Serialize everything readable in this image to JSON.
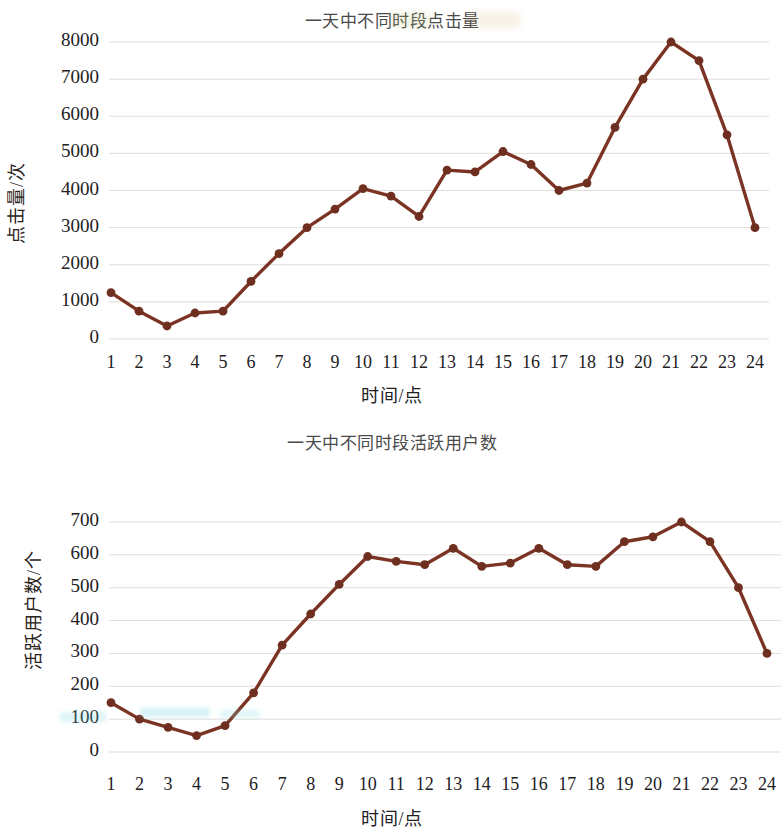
{
  "chart_data": [
    {
      "type": "line",
      "id": "clicks",
      "title": "一天中不同时段点击量",
      "xlabel": "时间/点",
      "ylabel": "点击量/次",
      "categories": [
        "1",
        "2",
        "3",
        "4",
        "5",
        "6",
        "7",
        "8",
        "9",
        "10",
        "11",
        "12",
        "13",
        "14",
        "15",
        "16",
        "17",
        "18",
        "19",
        "20",
        "21",
        "22",
        "23",
        "24"
      ],
      "values": [
        1250,
        750,
        350,
        700,
        750,
        1550,
        2300,
        3000,
        3500,
        4050,
        3850,
        3300,
        4550,
        4500,
        5050,
        4700,
        4000,
        4200,
        5700,
        7000,
        8000,
        7500,
        5500,
        3000
      ],
      "yticks": [
        "0",
        "1000",
        "2000",
        "3000",
        "4000",
        "5000",
        "6000",
        "7000",
        "8000"
      ],
      "ytick_values": [
        0,
        1000,
        2000,
        3000,
        4000,
        5000,
        6000,
        7000,
        8000
      ],
      "ylim": [
        0,
        8000
      ],
      "grid": true,
      "legend": "none",
      "line_color": "#7B3424",
      "marker_color": "#6E2F21"
    },
    {
      "type": "line",
      "id": "active-users",
      "title": "一天中不同时段活跃用户数",
      "xlabel": "时间/点",
      "ylabel": "活跃用户数/个",
      "categories": [
        "1",
        "2",
        "3",
        "4",
        "5",
        "6",
        "7",
        "8",
        "9",
        "10",
        "11",
        "12",
        "13",
        "14",
        "15",
        "16",
        "17",
        "18",
        "19",
        "20",
        "21",
        "22",
        "23",
        "24"
      ],
      "values": [
        150,
        100,
        75,
        50,
        80,
        180,
        325,
        420,
        510,
        595,
        580,
        570,
        620,
        565,
        575,
        620,
        570,
        565,
        640,
        655,
        700,
        640,
        500,
        300
      ],
      "yticks": [
        "0",
        "100",
        "200",
        "300",
        "400",
        "500",
        "600",
        "700"
      ],
      "ytick_values": [
        0,
        100,
        200,
        300,
        400,
        500,
        600,
        700
      ],
      "ylim": [
        0,
        700
      ],
      "grid": true,
      "legend": "none",
      "line_color": "#7B3424",
      "marker_color": "#6E2F21"
    }
  ],
  "charts": {
    "chart1": {
      "title": "一天中不同时段点击量",
      "xlabel": "时间/点",
      "ylabel": "点击量/次"
    },
    "chart2": {
      "title": "一天中不同时段活跃用户数",
      "xlabel": "时间/点",
      "ylabel": "活跃用户数/个"
    }
  }
}
